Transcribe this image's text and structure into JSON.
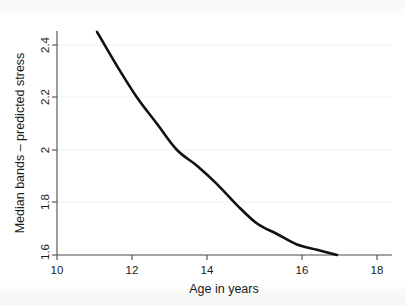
{
  "chart_data": {
    "type": "line",
    "title": "",
    "subtitle": "",
    "xlabel": "Age in years",
    "ylabel": "Median bands – predicted stress",
    "xlim": [
      10,
      18
    ],
    "ylim": [
      1.6,
      2.5
    ],
    "xticks": [
      "10",
      "12",
      "14",
      "16",
      "18"
    ],
    "xtick_values": [
      10,
      12,
      14,
      16,
      18
    ],
    "yticks": [
      "1.6",
      "1.8",
      "2",
      "2.2",
      "2.4"
    ],
    "ytick_values": [
      1.6,
      1.8,
      2.0,
      2.2,
      2.4
    ],
    "grid": false,
    "legend": "none",
    "series": [
      {
        "name": "Median bands – predicted stress",
        "color": "#111111",
        "x": [
          11.0,
          11.5,
          12.0,
          12.5,
          13.0,
          13.5,
          14.0,
          14.5,
          15.0,
          15.5,
          16.0,
          16.5,
          17.0
        ],
        "values": [
          2.45,
          2.32,
          2.2,
          2.1,
          2.0,
          1.94,
          1.87,
          1.79,
          1.72,
          1.68,
          1.64,
          1.62,
          1.6
        ]
      }
    ],
    "annotations": []
  },
  "figure": {
    "background": "#ffffff",
    "axis_color": "#4c4c4c",
    "line_color": "#111111"
  }
}
